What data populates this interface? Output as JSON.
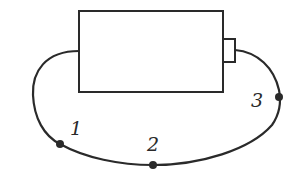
{
  "diagram": {
    "type": "circuit",
    "colors": {
      "stroke": "#2a2a2a",
      "background": "#ffffff"
    },
    "battery": {
      "body": {
        "x": 78,
        "y": 11,
        "width": 145,
        "height": 81
      },
      "terminal": {
        "x": 223,
        "y": 39,
        "width": 12,
        "height": 23
      }
    },
    "points": [
      {
        "id": "1",
        "label": "1",
        "x": 60,
        "y": 144,
        "label_x": 70,
        "label_y": 135
      },
      {
        "id": "2",
        "label": "2",
        "x": 153,
        "y": 165,
        "label_x": 147,
        "label_y": 150
      },
      {
        "id": "3",
        "label": "3",
        "x": 279,
        "y": 97,
        "label_x": 250,
        "label_y": 107
      }
    ]
  }
}
